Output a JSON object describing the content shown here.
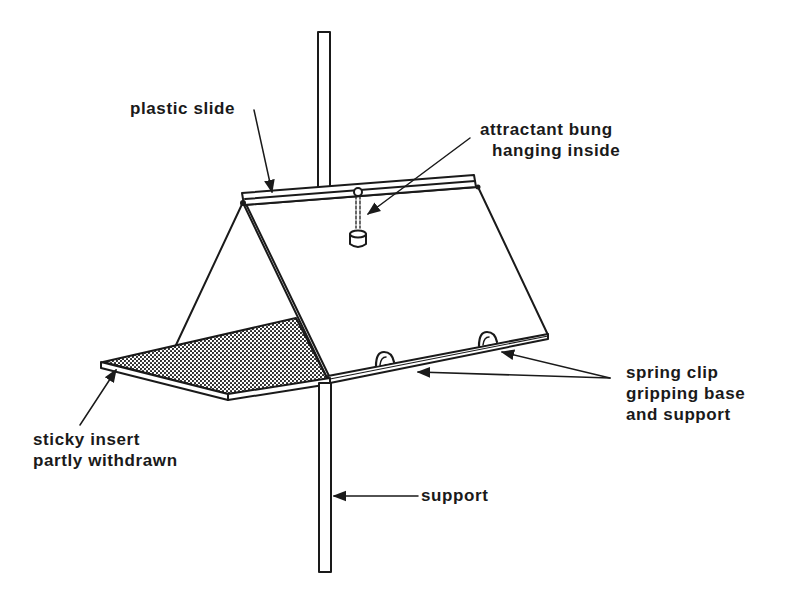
{
  "diagram": {
    "colors": {
      "ink": "#1a1a1a",
      "background": "#ffffff"
    },
    "labels": {
      "plastic_slide": {
        "text": "plastic slide"
      },
      "attractant": {
        "line1": "attractant bung",
        "line2": "hanging inside"
      },
      "spring_clip": {
        "line1": "spring clip",
        "line2": "gripping base",
        "line3": "and support"
      },
      "sticky_insert": {
        "line1": "sticky insert",
        "line2": "partly withdrawn"
      },
      "support": {
        "text": "support"
      }
    },
    "components": [
      "support-pole",
      "plastic-slide",
      "tent-roof",
      "attractant-bung",
      "base-plate",
      "sticky-insert",
      "spring-clips"
    ]
  }
}
